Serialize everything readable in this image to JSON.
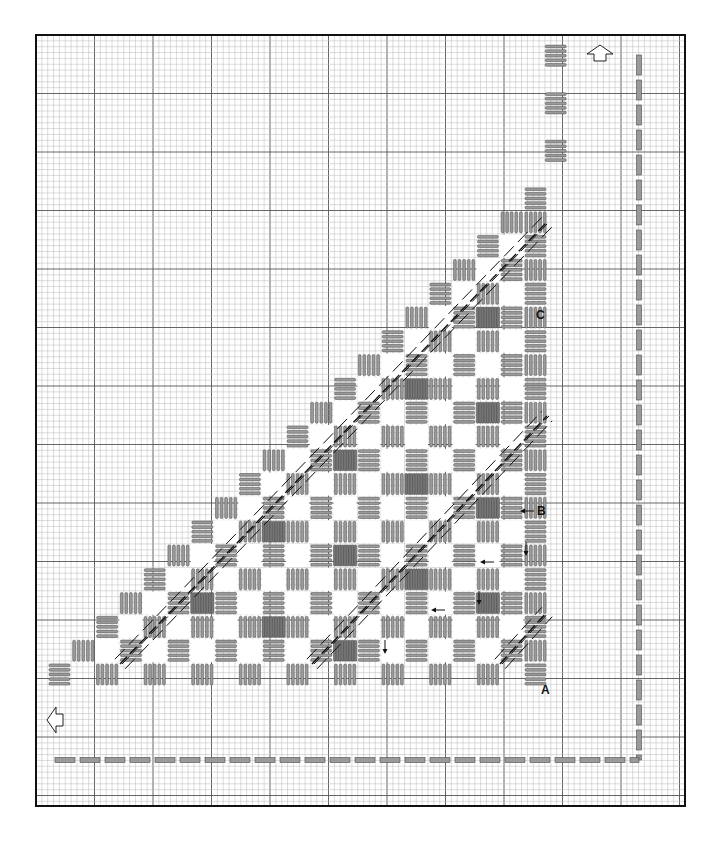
{
  "diagram": {
    "title": "",
    "frame": {
      "x": 36,
      "y": 35,
      "w": 649,
      "h": 771
    },
    "grid": {
      "cell": 5.85,
      "major_every": 10,
      "minor_color": "#b8b8b8",
      "major_color": "#555555"
    },
    "colors": {
      "stitch_fill": "#9a9a9a",
      "stitch_stroke": "#4a4a4a",
      "dense_fill": "#777777",
      "line": "#111111",
      "white": "#ffffff"
    },
    "lattice": {
      "x0": 48,
      "y0": 663,
      "u": 23.8,
      "size": 23
    },
    "labels": [
      {
        "id": "label-a",
        "text": "A",
        "x": 541,
        "y": 694
      },
      {
        "id": "label-b",
        "text": "B",
        "x": 537,
        "y": 515
      },
      {
        "id": "label-c",
        "text": "C",
        "x": 536,
        "y": 319
      }
    ],
    "arrows_small": [
      {
        "dir": "left",
        "x": 534,
        "y": 511
      },
      {
        "dir": "left",
        "x": 494,
        "y": 562
      },
      {
        "dir": "left",
        "x": 445,
        "y": 610
      },
      {
        "dir": "down",
        "x": 526,
        "y": 542
      },
      {
        "dir": "down",
        "x": 479,
        "y": 591
      },
      {
        "dir": "down",
        "x": 385,
        "y": 640
      }
    ],
    "direction_arrows": [
      {
        "id": "arrow-up",
        "dir": "up",
        "x": 600,
        "y": 52
      },
      {
        "id": "arrow-left",
        "dir": "left",
        "x": 54,
        "y": 720
      }
    ],
    "border_path": {
      "vertical": {
        "x": 639,
        "y1": 55,
        "y2": 760
      },
      "horizontal": {
        "y": 760,
        "x1": 55,
        "x2": 639
      },
      "dash": 20,
      "gap": 5,
      "thickness": 5
    },
    "diagonal_bands": [
      {
        "x1": 120,
        "y1": 664,
        "x2": 547,
        "y2": 222
      },
      {
        "x1": 312,
        "y1": 664,
        "x2": 547,
        "y2": 416
      },
      {
        "x1": 500,
        "y1": 664,
        "x2": 547,
        "y2": 612
      }
    ]
  }
}
